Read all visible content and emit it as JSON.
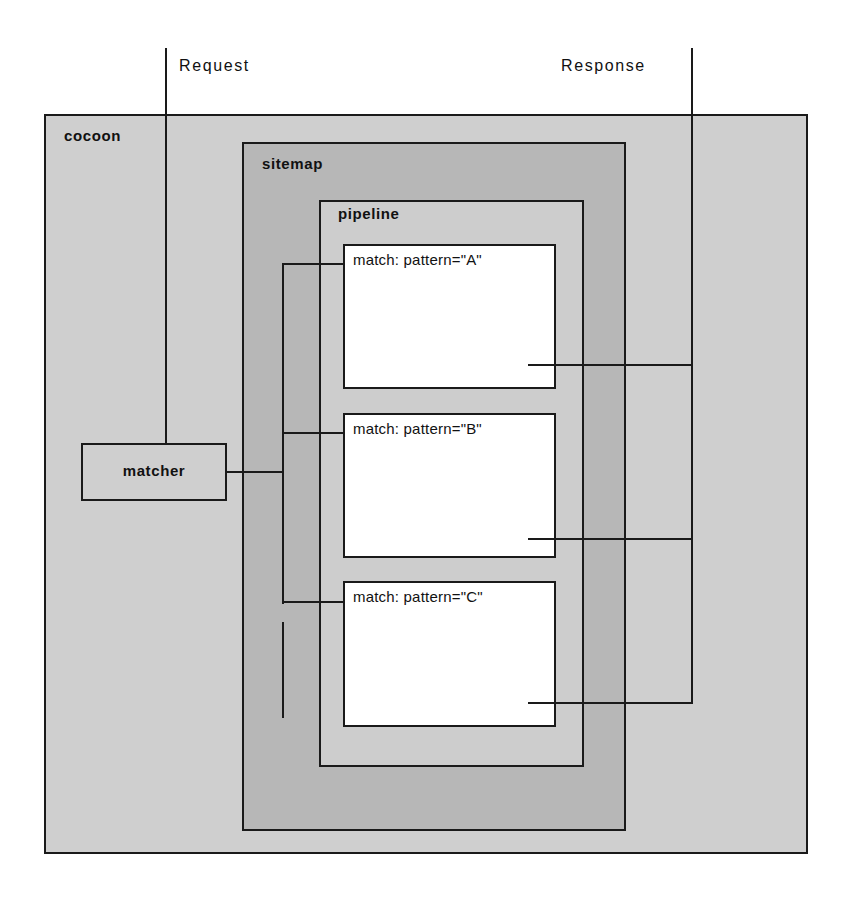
{
  "diagram": {
    "colors": {
      "cocoon_fill": "#cfcfcf",
      "sitemap_fill": "#b7b7b7",
      "pipeline_fill": "#cdcdcd",
      "match_fill": "#ffffff",
      "stroke": "#1a1a1a",
      "page_background": "#ffffff"
    },
    "trunks": {
      "request_label": "Request",
      "response_label": "Response"
    },
    "containers": {
      "cocoon": {
        "label": "cocoon"
      },
      "sitemap": {
        "label": "sitemap"
      },
      "pipeline": {
        "label": "pipeline"
      }
    },
    "matcher": {
      "label": "matcher"
    },
    "matches": [
      {
        "label": "match: pattern=\"A\""
      },
      {
        "label": "match: pattern=\"B\""
      },
      {
        "label": "match: pattern=\"C\""
      }
    ]
  }
}
